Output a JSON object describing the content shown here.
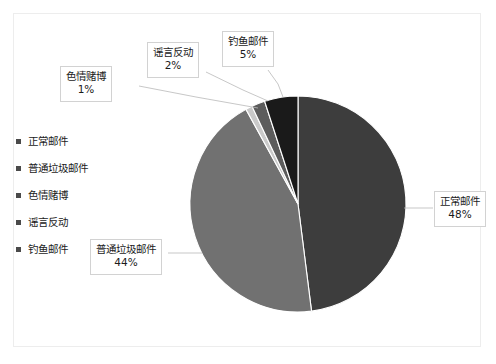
{
  "chart_data": {
    "type": "pie",
    "title": "",
    "subtitle": "",
    "xlabel": "",
    "ylabel": "",
    "grid": false,
    "legend_position": "left",
    "units": "percent",
    "start_angle_deg": 0,
    "direction": "clockwise",
    "categories": [
      "正常邮件",
      "普通垃圾邮件",
      "色情赌博",
      "谣言反动",
      "钓鱼邮件"
    ],
    "values": [
      48,
      44,
      1,
      2,
      5
    ],
    "labels": [
      "48%",
      "44%",
      "1%",
      "2%",
      "5%"
    ],
    "colors": [
      "#3d3d3d",
      "#717171",
      "#c9c9c9",
      "#5c5c5c",
      "#1a1a1a"
    ],
    "slices": [
      {
        "name": "正常邮件",
        "value": 48,
        "label": "48%",
        "color": "#3d3d3d"
      },
      {
        "name": "普通垃圾邮件",
        "value": 44,
        "label": "44%",
        "color": "#717171"
      },
      {
        "name": "色情赌博",
        "value": 1,
        "label": "1%",
        "color": "#c9c9c9"
      },
      {
        "name": "谣言反动",
        "value": 2,
        "label": "2%",
        "color": "#5c5c5c"
      },
      {
        "name": "钓鱼邮件",
        "value": 5,
        "label": "5%",
        "color": "#1a1a1a"
      }
    ]
  },
  "legend": {
    "items": [
      {
        "label": "正常邮件"
      },
      {
        "label": "普通垃圾邮件"
      },
      {
        "label": "色情赌博"
      },
      {
        "label": "谣言反动"
      },
      {
        "label": "钓鱼邮件"
      }
    ]
  },
  "callouts": {
    "normal": {
      "name": "正常邮件",
      "pct": "48%"
    },
    "spam": {
      "name": "普通垃圾邮件",
      "pct": "44%"
    },
    "porn": {
      "name": "色情赌博",
      "pct": "1%"
    },
    "rumor": {
      "name": "谣言反动",
      "pct": "2%"
    },
    "phishing": {
      "name": "钓鱼邮件",
      "pct": "5%"
    }
  },
  "style": {
    "frame_border": "#ededed",
    "callout_border": "#d2d2d2",
    "text_color": "#1b1b1b",
    "legend_swatch": "#4a4a4a",
    "slice_separator": "#ffffff",
    "leader_line": "#b9b9b9",
    "background": "#ffffff"
  }
}
